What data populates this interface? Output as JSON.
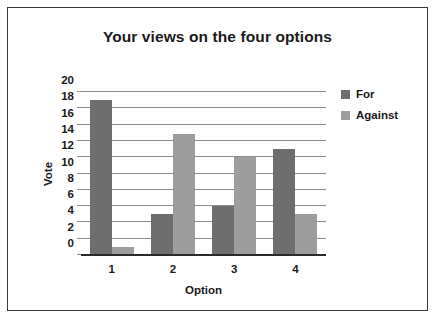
{
  "chart_data": {
    "type": "bar",
    "title": "Your views on the four options",
    "xlabel": "Option",
    "ylabel": "Vote",
    "categories": [
      "1",
      "2",
      "3",
      "4"
    ],
    "series": [
      {
        "name": "For",
        "color": "#6e6e6e",
        "values": [
          19,
          5,
          6,
          13
        ]
      },
      {
        "name": "Against",
        "color": "#9d9d9d",
        "values": [
          1,
          14.8,
          12,
          5
        ]
      }
    ],
    "ylim": [
      0,
      20
    ],
    "yticks": [
      0,
      2,
      4,
      6,
      8,
      10,
      12,
      14,
      16,
      18,
      20
    ],
    "ytick_labels": [
      "0",
      "2",
      "4",
      "6",
      "8",
      "10",
      "12",
      "14",
      "16",
      "18",
      "20"
    ],
    "grid": true,
    "legend_position": "right"
  }
}
